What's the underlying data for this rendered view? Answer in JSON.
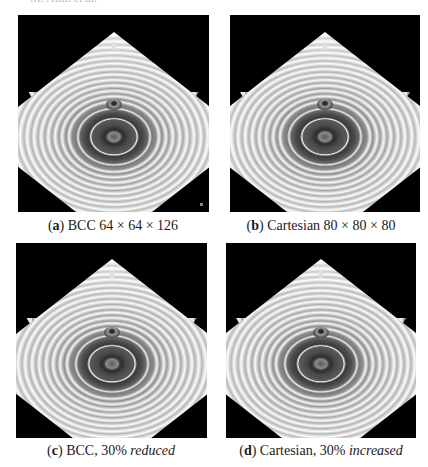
{
  "header": {
    "running_text": "M. Alim et al."
  },
  "figure": {
    "colors": {
      "background": "#000000",
      "surface_light": "#f4f4f4",
      "surface_dark": "#3d3d3d"
    },
    "panels": [
      {
        "id": "a",
        "label": "a",
        "caption_main": "BCC 64 × 64 × 126",
        "caption_emph": "",
        "render": "grayscale isosurface render, concentric rings on diamond-shaped terrace"
      },
      {
        "id": "b",
        "label": "b",
        "caption_main": "Cartesian 80 × 80 × 80",
        "caption_emph": "",
        "render": "grayscale isosurface render, concentric rings on diamond-shaped terrace"
      },
      {
        "id": "c",
        "label": "c",
        "caption_main": "BCC, 30% ",
        "caption_emph": "reduced",
        "render": "grayscale isosurface render, concentric rings on diamond-shaped terrace"
      },
      {
        "id": "d",
        "label": "d",
        "caption_main": "Cartesian, 30% ",
        "caption_emph": "increased",
        "render": "grayscale isosurface render, concentric rings on diamond-shaped terrace"
      }
    ]
  }
}
